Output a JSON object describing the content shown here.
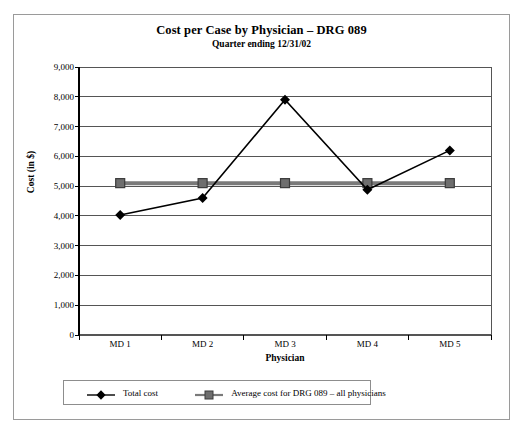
{
  "chart_data": {
    "type": "line",
    "title": "Cost per Case by Physician – DRG 089",
    "subtitle": "Quarter ending 12/31/02",
    "xlabel": "Physician",
    "ylabel": "Cost (in $)",
    "categories": [
      "MD 1",
      "MD 2",
      "MD 3",
      "MD 4",
      "MD 5"
    ],
    "ylim": [
      0,
      9000
    ],
    "ytick_values": [
      0,
      1000,
      2000,
      3000,
      4000,
      5000,
      6000,
      7000,
      8000,
      9000
    ],
    "ytick_labels": [
      "0",
      "1,000",
      "2,000",
      "3,000",
      "4,000",
      "5,000",
      "6,000",
      "7,000",
      "8,000",
      "9,000"
    ],
    "grid": true,
    "legend_position": "bottom",
    "series": [
      {
        "name": "Total cost",
        "marker": "diamond",
        "color": "#000000",
        "values": [
          4030,
          4600,
          7900,
          4880,
          6200
        ]
      },
      {
        "name": "Average cost for DRG 089 – all physicians",
        "marker": "square",
        "color": "#7a7a7a",
        "values": [
          5100,
          5100,
          5100,
          5100,
          5100
        ]
      }
    ]
  },
  "colors": {
    "frame": "#9a9a9a",
    "axis": "#000000",
    "gridline": "#555555",
    "total_cost": "#000000",
    "average_cost": "#7a7a7a"
  }
}
